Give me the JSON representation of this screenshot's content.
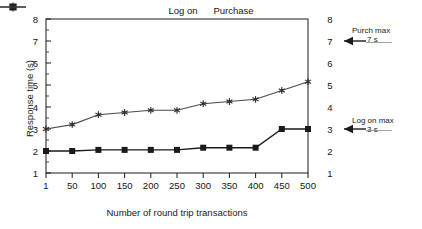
{
  "chart_data": {
    "type": "line",
    "title": "",
    "xlabel": "Number of round trip transactions",
    "ylabel": "Response time (s)",
    "categories": [
      "1",
      "50",
      "100",
      "150",
      "200",
      "250",
      "300",
      "350",
      "400",
      "450",
      "500"
    ],
    "x": [
      1,
      50,
      100,
      150,
      200,
      250,
      300,
      350,
      400,
      450,
      500
    ],
    "ylim": [
      1,
      8
    ],
    "yticks": [
      1,
      2,
      3,
      4,
      5,
      6,
      7,
      8
    ],
    "y_right_ticks": [
      1,
      2,
      3,
      4,
      5,
      6,
      7,
      8
    ],
    "grid": false,
    "legend_position": "top-center",
    "series": [
      {
        "name": "Log on",
        "marker": "square",
        "color": "#1a1a1a",
        "values": [
          2.0,
          2.0,
          2.05,
          2.05,
          2.05,
          2.05,
          2.15,
          2.15,
          2.15,
          3.0,
          3.0
        ]
      },
      {
        "name": "Purchase",
        "marker": "star",
        "color": "#4a4a4a",
        "values": [
          3.0,
          3.2,
          3.65,
          3.75,
          3.85,
          3.85,
          4.15,
          4.25,
          4.35,
          4.75,
          5.15
        ]
      }
    ],
    "annotations": [
      {
        "title": "Purch max",
        "value": "7 s",
        "at_y": 7
      },
      {
        "title": "Log on max",
        "value": "3 s",
        "at_y": 3
      }
    ]
  },
  "legend": {
    "items": [
      {
        "label": "Log on"
      },
      {
        "label": "Purchase"
      }
    ]
  },
  "axes": {
    "ylabel": "Response time (s)",
    "xlabel": "Number of round trip transactions",
    "ytick_labels": [
      "8",
      "7",
      "6",
      "5",
      "4",
      "3",
      "2",
      "1"
    ],
    "ytick_labels_right": [
      "8",
      "7",
      "6",
      "5",
      "4",
      "3",
      "2",
      "1"
    ],
    "xtick_labels": [
      "1",
      "50",
      "100",
      "150",
      "200",
      "250",
      "300",
      "350",
      "400",
      "450",
      "500"
    ]
  },
  "annotations": {
    "purch": {
      "title": "Purch max",
      "value": "7 s"
    },
    "logon": {
      "title": "Log on max",
      "value": "3 s"
    }
  },
  "colors": {
    "axis": "#1a1a1a",
    "logon": "#1a1a1a",
    "purchase": "#4a4a4a",
    "background": "#ffffff"
  }
}
